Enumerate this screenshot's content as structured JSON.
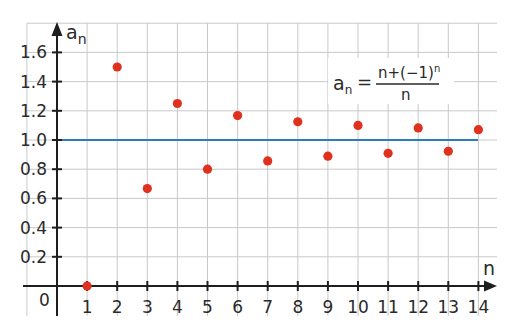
{
  "chart_data": {
    "type": "scatter",
    "title": "",
    "xlabel": "n",
    "ylabel": "a_n",
    "formula": {
      "lhs": "a",
      "lhs_sub": "n",
      "equals": "=",
      "numerator": "n+(−1)",
      "numerator_sup": "n",
      "denominator": "n"
    },
    "x": [
      1,
      2,
      3,
      4,
      5,
      6,
      7,
      8,
      9,
      10,
      11,
      12,
      13,
      14
    ],
    "values": [
      0,
      1.5,
      0.667,
      1.25,
      0.8,
      1.167,
      0.857,
      1.125,
      0.889,
      1.1,
      0.909,
      1.083,
      0.923,
      1.071
    ],
    "reference_line": {
      "y": 1.0,
      "color": "#2b7bbf"
    },
    "point_color": "#e0301e",
    "x_ticks": [
      "1",
      "2",
      "3",
      "4",
      "5",
      "6",
      "7",
      "8",
      "9",
      "10",
      "11",
      "12",
      "13",
      "14"
    ],
    "y_ticks": [
      "0.2",
      "0.4",
      "0.6",
      "0.8",
      "1.0",
      "1.2",
      "1.4",
      "1.6"
    ],
    "origin_label": "0",
    "xlim": [
      0,
      14.5
    ],
    "ylim": [
      0,
      1.8
    ],
    "grid": true,
    "legend": null
  }
}
